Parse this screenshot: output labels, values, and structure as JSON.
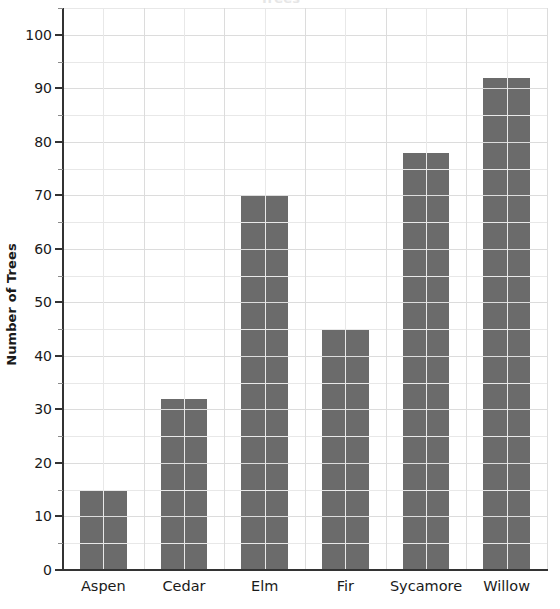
{
  "chart_data": {
    "type": "bar",
    "title": "",
    "title_remnant": "Trees",
    "xlabel": "",
    "ylabel": "Number of Trees",
    "categories": [
      "Aspen",
      "Cedar",
      "Elm",
      "Fir",
      "Sycamore",
      "Willow"
    ],
    "values": [
      15,
      32,
      70,
      45,
      78,
      92
    ],
    "ylim": [
      0,
      100
    ],
    "y_major_ticks": [
      0,
      10,
      20,
      30,
      40,
      50,
      60,
      70,
      80,
      90,
      100
    ],
    "y_minor_ticks": [
      5,
      15,
      25,
      35,
      45,
      55,
      65,
      75,
      85,
      95,
      105
    ],
    "y_tick_labels": [
      "0",
      "10",
      "20",
      "30",
      "40",
      "50",
      "60",
      "70",
      "80",
      "90",
      "100"
    ],
    "grid": true,
    "grid_axis": "both",
    "legend": false,
    "legend_position": "none",
    "bar_color": "#6b6b6b",
    "grid_color": "#e8e8e8",
    "axis_color": "#333333",
    "background_color": "#ffffff",
    "text_color": "#1a1a1a",
    "bar_width_fraction": 0.58,
    "y_axis_top_value": 105
  }
}
